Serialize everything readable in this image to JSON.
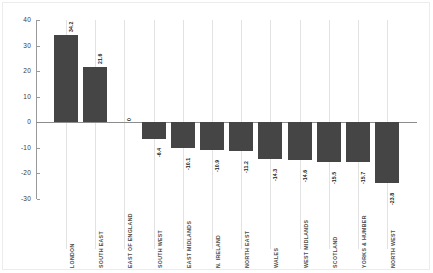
{
  "chart_data": {
    "type": "bar",
    "title": "",
    "subtitle": "",
    "xlabel": "",
    "ylabel": "",
    "ylim": [
      -30,
      40
    ],
    "yticks": [
      40,
      30,
      20,
      10,
      0,
      -10,
      -20,
      -30
    ],
    "ytick_labels": [
      "40",
      "30",
      "20",
      "10",
      "0",
      "-10",
      "-20",
      "-30"
    ],
    "grid": "vertical",
    "legend": "none",
    "orientation": "vertical",
    "bar_color": "#454545",
    "zero_line_color": "#8c8c8c",
    "gridline_color": "#e2e2e2",
    "categories": [
      "LONDON",
      "SOUTH EAST",
      "EAST OF ENGLAND",
      "SOUTH WEST",
      "EAST MIDLANDS",
      "N. IRELAND",
      "NORTH EAST",
      "WALES",
      "WEST MIDLANDS",
      "SCOTLAND",
      "YORKS & HUMBER",
      "NORTH WEST"
    ],
    "values": [
      34.2,
      21.6,
      0,
      -6.4,
      -10.1,
      -10.9,
      -11.2,
      -14.3,
      -14.6,
      -15.5,
      -15.7,
      -23.8
    ],
    "value_labels": [
      "34.2",
      "21.6",
      "0",
      "-6.4",
      "-10.1",
      "-10.9",
      "-11.2",
      "-14.3",
      "-14.6",
      "-15.5",
      "-15.7",
      "-23.8"
    ]
  }
}
